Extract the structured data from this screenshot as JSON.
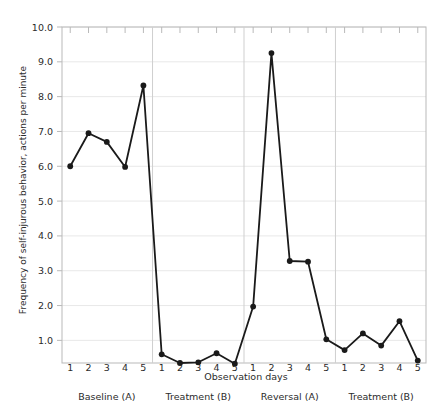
{
  "chart_data": {
    "type": "line",
    "title": "",
    "xlabel": "Observation days",
    "ylabel": "Frequency of self-injurous behavior, actions per minute",
    "ylim": [
      0.35,
      10.0
    ],
    "yticks": [
      "1.0",
      "2.0",
      "3.0",
      "4.0",
      "5.0",
      "6.0",
      "7.0",
      "8.0",
      "9.0",
      "10.0"
    ],
    "ytick_values": [
      1.0,
      2.0,
      3.0,
      4.0,
      5.0,
      6.0,
      7.0,
      8.0,
      9.0,
      10.0
    ],
    "grid": true,
    "legend": "none",
    "x": [
      1,
      2,
      3,
      4,
      5,
      6,
      7,
      8,
      9,
      10,
      11,
      12,
      13,
      14,
      15,
      16,
      17,
      18,
      19,
      20
    ],
    "xtick_labels": [
      "1",
      "2",
      "3",
      "4",
      "5",
      "1",
      "2",
      "3",
      "4",
      "5",
      "1",
      "2",
      "3",
      "4",
      "5",
      "1",
      "2",
      "3",
      "4",
      "5"
    ],
    "values": [
      6.0,
      6.95,
      6.7,
      5.98,
      8.32,
      0.6,
      0.35,
      0.37,
      0.63,
      0.33,
      1.97,
      9.25,
      3.28,
      3.26,
      1.03,
      0.72,
      1.2,
      0.85,
      1.55,
      0.42
    ],
    "phases": [
      {
        "label": "Baseline (A)",
        "start": 1,
        "end": 5
      },
      {
        "label": "Treatment (B)",
        "start": 6,
        "end": 10
      },
      {
        "label": "Reversal (A)",
        "start": 11,
        "end": 15
      },
      {
        "label": "Treatment (B)",
        "start": 16,
        "end": 20
      }
    ],
    "phase_dividers": [
      5.5,
      10.5,
      15.5
    ],
    "series": [
      {
        "name": "Frequency of self-injurous behavior",
        "values": [
          6.0,
          6.95,
          6.7,
          5.98,
          8.32,
          0.6,
          0.35,
          0.37,
          0.63,
          0.33,
          1.97,
          9.25,
          3.28,
          3.26,
          1.03,
          0.72,
          1.2,
          0.85,
          1.55,
          0.42
        ]
      }
    ],
    "marker": "circle",
    "line_color": "#1a1a1a",
    "marker_color": "#1a1a1a",
    "grid_color": "#e8e8e8",
    "axis_color": "#b9b9b9",
    "background_color": "#ffffff"
  }
}
